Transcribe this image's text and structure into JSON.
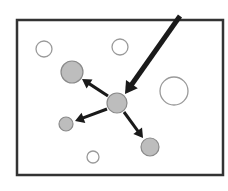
{
  "figure": {
    "type": "diagram",
    "caption_fragment": "",
    "frame": {
      "x": 17,
      "y": 20,
      "width": 206,
      "height": 155,
      "stroke": "#333333",
      "stroke_width": 2.5
    },
    "colors": {
      "filled_circle": "#bdbdbd",
      "filled_stroke": "#8a8a8a",
      "open_circle_stroke": "#9a9a9a",
      "arrow": "#1a1a1a"
    },
    "circles": [
      {
        "id": "open-top-left",
        "cx": 44,
        "cy": 49,
        "r": 8,
        "filled": false
      },
      {
        "id": "open-top-middle",
        "cx": 120,
        "cy": 47,
        "r": 8,
        "filled": false
      },
      {
        "id": "open-right-large",
        "cx": 174,
        "cy": 91,
        "r": 14,
        "filled": false
      },
      {
        "id": "open-bottom-small",
        "cx": 93,
        "cy": 157,
        "r": 6,
        "filled": false
      },
      {
        "id": "filled-upper-left",
        "cx": 72,
        "cy": 72,
        "r": 11,
        "filled": true
      },
      {
        "id": "filled-center",
        "cx": 117,
        "cy": 103,
        "r": 10,
        "filled": true
      },
      {
        "id": "filled-lower-left",
        "cx": 66,
        "cy": 124,
        "r": 7,
        "filled": true
      },
      {
        "id": "filled-lower-right",
        "cx": 150,
        "cy": 147,
        "r": 9,
        "filled": true
      }
    ],
    "arrows": [
      {
        "id": "incoming-arrow",
        "x1": 180,
        "y1": 16,
        "x2": 125,
        "y2": 94,
        "width": 5,
        "head": 12
      },
      {
        "id": "arrow-to-upper-left",
        "x1": 108,
        "y1": 96,
        "x2": 82,
        "y2": 79,
        "width": 3,
        "head": 9
      },
      {
        "id": "arrow-to-lower-left",
        "x1": 107,
        "y1": 109,
        "x2": 75,
        "y2": 121,
        "width": 3,
        "head": 9
      },
      {
        "id": "arrow-to-lower-right",
        "x1": 124,
        "y1": 112,
        "x2": 143,
        "y2": 138,
        "width": 3,
        "head": 9
      }
    ]
  }
}
